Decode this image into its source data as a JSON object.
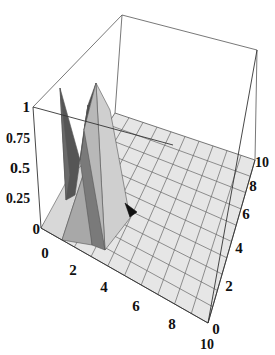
{
  "chart_data": {
    "type": "surface3d",
    "title": "",
    "xlabel": "",
    "ylabel": "",
    "zlabel": "",
    "x_ticks": [
      "0",
      "2",
      "4",
      "6",
      "8",
      "10"
    ],
    "y_ticks": [
      "0",
      "2",
      "4",
      "6",
      "8",
      "10"
    ],
    "z_ticks": [
      "0",
      "0.25",
      "0.5",
      "0.75",
      "1"
    ],
    "x_range": [
      0,
      10
    ],
    "y_range": [
      0,
      10
    ],
    "z_range": [
      0,
      1
    ],
    "grid": true,
    "box": true,
    "peak": {
      "x": 2,
      "y": 0.5,
      "z": 1.0
    },
    "surface_color": "#e4e4e4",
    "shade_colors": [
      "#4a4a4a",
      "#7a7a7a",
      "#a8a8a8",
      "#d0d0d0",
      "#111111"
    ]
  },
  "labels": {
    "z": [
      "1",
      "0.75",
      "0.5",
      "0.25",
      "0"
    ],
    "x": [
      "0",
      "2",
      "4",
      "6",
      "8",
      "10"
    ],
    "y": [
      "0",
      "2",
      "4",
      "6",
      "8",
      "10"
    ]
  }
}
